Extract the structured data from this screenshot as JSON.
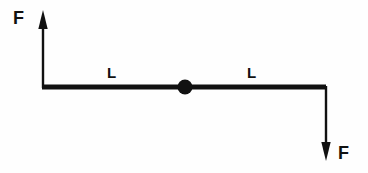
{
  "figure": {
    "type": "free-body-diagram",
    "background_color": "#fefefe",
    "stroke_color": "#111111",
    "canvas": {
      "width": 368,
      "height": 173
    }
  },
  "labels": {
    "force_top": "F",
    "force_bottom": "F",
    "length_left": "L",
    "length_right": "L"
  },
  "geometry": {
    "beam": {
      "x_start": 43,
      "x_end": 326,
      "y": 87,
      "thickness": 5
    },
    "pivot": {
      "cx": 185,
      "cy": 87,
      "r": 7.5
    },
    "arrow_up": {
      "x": 43,
      "y_tail": 87,
      "y_tip": 10,
      "direction": "up",
      "shaft_width": 2.4,
      "head_width": 10,
      "head_length": 19
    },
    "arrow_down": {
      "x": 326,
      "y_tail": 87,
      "y_tip": 161,
      "direction": "down",
      "shaft_width": 2.4,
      "head_width": 10,
      "head_length": 19
    }
  }
}
